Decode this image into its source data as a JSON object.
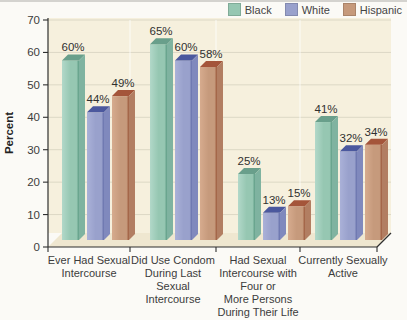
{
  "chart_data": {
    "type": "bar",
    "ylabel": "Percent",
    "ylim": [
      0,
      70
    ],
    "yticks": [
      0,
      10,
      20,
      30,
      40,
      50,
      60,
      70
    ],
    "unit": "%",
    "grid": true,
    "legend_position": "top-right",
    "categories": [
      "Ever Had Sexual Intercourse",
      "Did Use Condom During Last Sexual Intercourse",
      "Had Sexual Intercourse with Four or More Persons During Their Life",
      "Currently Sexually Active"
    ],
    "category_label_lines": [
      [
        "Ever Had Sexual",
        "Intercourse"
      ],
      [
        "Did Use Condom",
        "During Last",
        "Sexual",
        "Intercourse"
      ],
      [
        "Had Sexual",
        "Intercourse with",
        "Four or",
        "More Persons",
        "During Their Life"
      ],
      [
        "Currently Sexually",
        "Active"
      ]
    ],
    "series": [
      {
        "name": "Black",
        "values": [
          60,
          65,
          25,
          41
        ],
        "colors": {
          "front": "#96c7b2",
          "front_light": "#b2d8c9",
          "front_edge": "#5f9d86",
          "top": "#699f8b",
          "side": "#7fb3a0"
        }
      },
      {
        "name": "White",
        "values": [
          44,
          60,
          13,
          32
        ],
        "colors": {
          "front": "#99a1cc",
          "front_light": "#aab1d8",
          "front_edge": "#6670ab",
          "top": "#4b589e",
          "side": "#8089bd"
        }
      },
      {
        "name": "Hispanic",
        "values": [
          49,
          58,
          15,
          34
        ],
        "colors": {
          "front": "#c69a7c",
          "front_light": "#d6ab8e",
          "front_edge": "#9c5a3d",
          "top": "#a4553a",
          "side": "#b27e62"
        }
      }
    ],
    "plot_background": "#f6f0dd",
    "floor_background": "#efe7d0",
    "gridline_color": "#dcd8c5",
    "separator_color": "rgba(255,255,255,0.6)",
    "axis_color": "#2f2f2f",
    "text_color": "#3c3c3c",
    "value_label_color": "#303030"
  }
}
